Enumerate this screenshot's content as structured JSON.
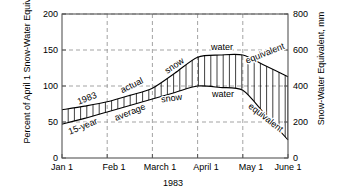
{
  "chart_data": {
    "type": "area",
    "title": "",
    "xlabel": "1983",
    "ylabel_left": "Percent of April 1 Snow-Water Equivalent",
    "ylabel_right": "Snow-Water Equivalent, mm",
    "x_tick_labels": [
      "Jan 1",
      "Feb 1",
      "March 1",
      "April 1",
      "May 1",
      "June 1"
    ],
    "y_tick_labels_left": [
      "200",
      "150",
      "100",
      "50",
      "0"
    ],
    "y_tick_labels_right": [
      "800",
      "600",
      "400",
      "200",
      "0"
    ],
    "ylim_left": [
      0,
      200
    ],
    "ylim_right": [
      0,
      800
    ],
    "grid": true,
    "legend": "none",
    "series": [
      {
        "name": "1983 actual snow water equivalent",
        "x": [
          "Jan 1",
          "Jan 15",
          "Feb 1",
          "Feb 15",
          "March 1",
          "March 15",
          "April 1",
          "April 15",
          "May 1",
          "May 15",
          "June 1"
        ],
        "values": [
          67,
          72,
          78,
          87,
          97,
          118,
          140,
          143,
          143,
          128,
          113
        ]
      },
      {
        "name": "15-year average snow water equivalent",
        "x": [
          "Jan 1",
          "Jan 15",
          "Feb 1",
          "Feb 15",
          "March 1",
          "March 15",
          "April 1",
          "April 15",
          "May 1",
          "May 15",
          "June 1"
        ],
        "values": [
          47,
          55,
          64,
          73,
          82,
          91,
          100,
          98,
          94,
          60,
          25
        ]
      }
    ],
    "annotations": [
      {
        "id": "a1",
        "text": "1983",
        "x": 88,
        "y": 101,
        "rotate": -22
      },
      {
        "id": "a2",
        "text": "15-year",
        "x": 84,
        "y": 129,
        "rotate": -22
      },
      {
        "id": "a3",
        "text": "actual",
        "x": 133,
        "y": 88,
        "rotate": -26
      },
      {
        "id": "a4",
        "text": "average",
        "x": 131,
        "y": 115,
        "rotate": -22
      },
      {
        "id": "a5",
        "text": "snow",
        "x": 176,
        "y": 68,
        "rotate": -34
      },
      {
        "id": "a6",
        "text": "snow",
        "x": 172,
        "y": 101,
        "rotate": -8
      },
      {
        "id": "a7",
        "text": "water",
        "x": 222,
        "y": 50,
        "rotate": 0
      },
      {
        "id": "a8",
        "text": "water",
        "x": 223,
        "y": 97,
        "rotate": 0
      },
      {
        "id": "a9",
        "text": "equivalent",
        "x": 266,
        "y": 56,
        "rotate": -22
      },
      {
        "id": "a10",
        "text": "equivalent",
        "x": 264,
        "y": 120,
        "rotate": 38
      }
    ]
  },
  "style": {
    "axis_color": "#444444",
    "grid_color": "#999999",
    "curve_color": "#000000",
    "hatch_color": "#000000",
    "background": "#ffffff"
  }
}
